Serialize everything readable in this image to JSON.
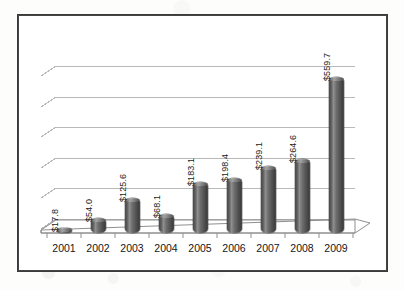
{
  "chart_data": {
    "type": "bar",
    "title": "",
    "subtitle": "",
    "xlabel": "",
    "ylabel": "",
    "categories": [
      "2001",
      "2002",
      "2003",
      "2004",
      "2005",
      "2006",
      "2007",
      "2008",
      "2009"
    ],
    "values": [
      17.8,
      54.0,
      125.6,
      68.1,
      183.1,
      198.4,
      239.1,
      264.6,
      559.7
    ],
    "data_labels": [
      "$17.8",
      "$54.0",
      "$125.6",
      "$68.1",
      "$183.1",
      "$198.4",
      "$239.1",
      "$264.6",
      "$559.7"
    ],
    "series": [
      {
        "name": "",
        "values": [
          17.8,
          54.0,
          125.6,
          68.1,
          183.1,
          198.4,
          239.1,
          264.6,
          559.7
        ]
      }
    ],
    "ylim": [
      0,
      600
    ],
    "y_gridline_values": [
      0,
      100,
      200,
      300,
      400,
      500,
      600
    ],
    "grid": true,
    "grid_axis": "y",
    "legend": false,
    "legend_position": "none",
    "y_axis_tick_labels_visible": false,
    "data_label_orientation": "rotated-90",
    "chart_style": "3d-cylinder-bars",
    "annotations": []
  },
  "style": {
    "bar_color": "#585858",
    "bar_highlight": "#9a9a9a",
    "bar_shadow": "#3f3f3f",
    "gridline_color": "#b9b9b9",
    "frame_color": "#3b3b3b",
    "plot_background": "#ffffff",
    "page_background": "#fdfdfc",
    "label_color": "#1c1c1c"
  },
  "labels": {
    "value_0": "$17.8",
    "value_1": "$54.0",
    "value_2": "$125.6",
    "value_3": "$68.1",
    "value_4": "$183.1",
    "value_5": "$198.4",
    "value_6": "$239.1",
    "value_7": "$264.6",
    "value_8": "$559.7",
    "cat_0": "2001",
    "cat_1": "2002",
    "cat_2": "2003",
    "cat_3": "2004",
    "cat_4": "2005",
    "cat_5": "2006",
    "cat_6": "2007",
    "cat_7": "2008",
    "cat_8": "2009"
  }
}
